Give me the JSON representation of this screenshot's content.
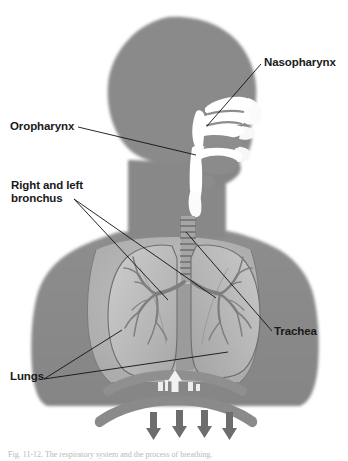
{
  "figure": {
    "caption": "Fig. 11-12.  The respiratory system and the process of breathing."
  },
  "palette": {
    "body_silhouette": "#8a8a8a",
    "body_silhouette_dark": "#7d7d7d",
    "cavity_white": "#fdfdfd",
    "lung_fill": "#b5b5b5",
    "lung_fill_light": "#c6c6c6",
    "lung_outline": "#6f6f6f",
    "trachea": "#9a9a9a",
    "diaphragm": "#8f8f8f",
    "arrow": "#6d6d6d",
    "leader_line": "#111111",
    "label_text": "#1a1a1a",
    "background": "#ffffff"
  },
  "labels": [
    {
      "id": "nasopharynx",
      "text": "Nasopharynx"
    },
    {
      "id": "oropharynx",
      "text": "Oropharynx"
    },
    {
      "id": "bronchus",
      "text": "Right and left\nbronchus"
    },
    {
      "id": "trachea",
      "text": "Trachea"
    },
    {
      "id": "lungs",
      "text": "Lungs"
    }
  ],
  "breathing_arrows": {
    "up_count": 1,
    "down_count": 4,
    "up_meaning": "exhalation",
    "down_meaning": "inhalation"
  }
}
